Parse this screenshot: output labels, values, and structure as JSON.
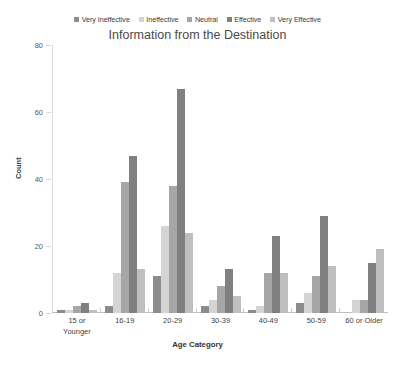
{
  "chart_data": {
    "type": "bar",
    "title": "Information from the Destination",
    "xlabel": "Age Category",
    "ylabel": "Count",
    "ylim": [
      0,
      80
    ],
    "yticks": [
      0,
      20,
      40,
      60,
      80
    ],
    "grid": false,
    "legend_position": "top",
    "categories": [
      "15 or Younger",
      "16-19",
      "20-29",
      "30-39",
      "40-49",
      "50-59",
      "60 or Older"
    ],
    "series": [
      {
        "name": "Very Ineffective",
        "color": "#8c8c8c",
        "values": [
          1,
          2,
          11,
          2,
          1,
          3,
          0
        ]
      },
      {
        "name": "Ineffective",
        "color": "#d4d4d4",
        "values": [
          1,
          12,
          26,
          4,
          2,
          6,
          4
        ]
      },
      {
        "name": "Neutral",
        "color": "#a6a6a6",
        "values": [
          2,
          39,
          38,
          8,
          12,
          11,
          4
        ]
      },
      {
        "name": "Effective",
        "color": "#808080",
        "values": [
          3,
          47,
          67,
          13,
          23,
          29,
          15
        ]
      },
      {
        "name": "Very Effective",
        "color": "#bfbfbf",
        "values": [
          1,
          13,
          24,
          5,
          12,
          14,
          19
        ]
      }
    ]
  },
  "axis": {
    "y_title": "Count",
    "x_title": "Age Category",
    "y_tick_labels": [
      "0",
      "20",
      "40",
      "60",
      "80"
    ]
  },
  "category_lines": [
    [
      "15 or",
      "Younger"
    ],
    [
      "16-19"
    ],
    [
      "20-29"
    ],
    [
      "30-39"
    ],
    [
      "40-49"
    ],
    [
      "50-59"
    ],
    [
      "60 or Older"
    ]
  ]
}
